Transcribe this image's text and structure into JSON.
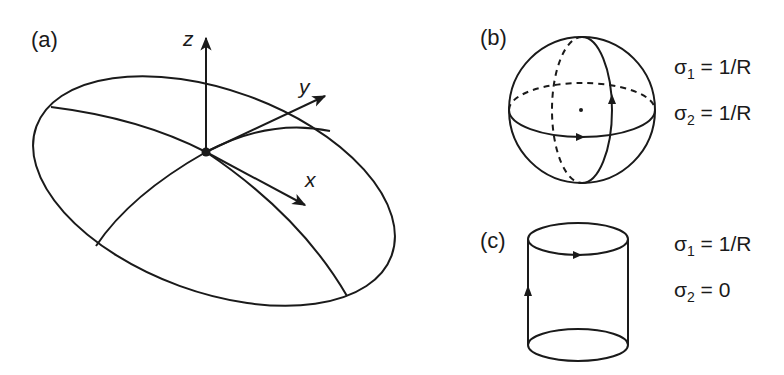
{
  "figure": {
    "panels": [
      {
        "id": "a",
        "label": "(a)",
        "description": "Curved surface with local coordinate frame at a point",
        "axes": {
          "x": "x",
          "y": "y",
          "z": "z"
        }
      },
      {
        "id": "b",
        "label": "(b)",
        "description": "Sphere",
        "equations": [
          {
            "symbol": "σ",
            "sub": "1",
            "rhs": " = 1/R"
          },
          {
            "symbol": "σ",
            "sub": "2",
            "rhs": " = 1/R"
          }
        ]
      },
      {
        "id": "c",
        "label": "(c)",
        "description": "Cylinder",
        "equations": [
          {
            "symbol": "σ",
            "sub": "1",
            "rhs": " = 1/R"
          },
          {
            "symbol": "σ",
            "sub": "2",
            "rhs": " = 0"
          }
        ]
      }
    ],
    "colors": {
      "stroke": "#1a1a1a",
      "background": "#ffffff"
    }
  }
}
